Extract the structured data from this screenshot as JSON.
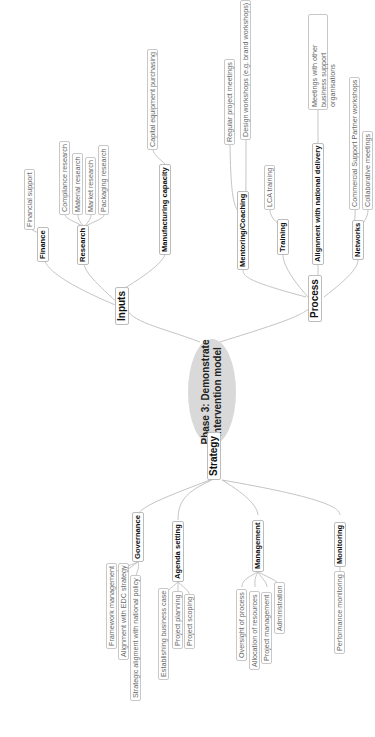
{
  "diagram": {
    "type": "mind-map",
    "orientation": "rotated-90-ccw",
    "center": {
      "line1": "Phase 3: Demonstrate",
      "line2": "intervention model"
    },
    "colors": {
      "center_fill": "#d9d9d9",
      "link": "#c0c0c0",
      "border": "#c8c8c8"
    },
    "branches": {
      "inputs": {
        "label": "Inputs",
        "children": {
          "finance": {
            "label": "Finance",
            "items": [
              "Financial support"
            ]
          },
          "research": {
            "label": "Research",
            "items": [
              "Compliance research",
              "Material research",
              "Market research",
              "Packaging research"
            ]
          },
          "manufacturing": {
            "label": "Manufacturing capacity",
            "items": [
              "Capital equipment purchasing"
            ]
          }
        }
      },
      "process": {
        "label": "Process",
        "children": {
          "mentoring": {
            "label": "Mentoring/Coaching",
            "items": [
              "Regular project meetings",
              "Design workshops (e.g. brand workshops)"
            ]
          },
          "training": {
            "label": "Training",
            "items": [
              "LCA training"
            ]
          },
          "alignment": {
            "label": "Alignment with national delivery",
            "items": [
              "Meetings with other business support organisations"
            ]
          },
          "networks": {
            "label": "Networks",
            "items": [
              "Commercial Support Partner workshops",
              "Collaborative meetings"
            ]
          }
        }
      },
      "strategy": {
        "label": "Strategy",
        "children": {
          "governance": {
            "label": "Governance",
            "items": [
              "Framework management",
              "Alignment with EDC strategy",
              "Strategic aligment with national policy"
            ]
          },
          "agenda": {
            "label": "Agenda setting",
            "items": [
              "Establishing business case",
              "Project planning",
              "Project scoping"
            ]
          },
          "management": {
            "label": "Management",
            "items": [
              "Oversight of process",
              "Allocation of resources",
              "Project management",
              "Administration"
            ]
          },
          "monitoring": {
            "label": "Monitoring",
            "items": [
              "Performance monitoring"
            ]
          }
        }
      }
    }
  }
}
